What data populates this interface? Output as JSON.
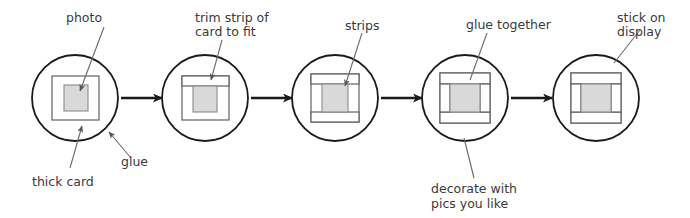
{
  "diagram": {
    "type": "process-flow",
    "step_count": 5,
    "colors": {
      "stroke": "#1a1a1a",
      "frame_stroke": "#555555",
      "photo_fill": "#d9d9d9",
      "strip_fill": "#ffffff",
      "text": "#3a3a3a",
      "leader": "#6b6b6b",
      "background": "#ffffff"
    },
    "steps": [
      {
        "id": "step-1",
        "caption": "photo, thick card, glue"
      },
      {
        "id": "step-2",
        "caption": "trim strip of card to fit"
      },
      {
        "id": "step-3",
        "caption": "strips"
      },
      {
        "id": "step-4",
        "caption": "glue together, decorate with pics you like"
      },
      {
        "id": "step-5",
        "caption": "stick on display"
      }
    ],
    "labels": [
      {
        "id": "photo",
        "text": "photo",
        "lines": [
          "photo"
        ],
        "position": "top",
        "target_step": 1
      },
      {
        "id": "trim-strip",
        "text": "trim strip of card to fit",
        "lines": [
          "trim strip of",
          "card to fit"
        ],
        "position": "top",
        "target_step": 2
      },
      {
        "id": "strips",
        "text": "strips",
        "lines": [
          "strips"
        ],
        "position": "top",
        "target_step": 3
      },
      {
        "id": "glue-together",
        "text": "glue together",
        "lines": [
          "glue together"
        ],
        "position": "top",
        "target_step": 4
      },
      {
        "id": "stick-on-display",
        "text": "stick on display",
        "lines": [
          "stick on",
          "display"
        ],
        "position": "top",
        "target_step": 5
      },
      {
        "id": "glue",
        "text": "glue",
        "lines": [
          "glue"
        ],
        "position": "bottom",
        "target_step": 1
      },
      {
        "id": "thick-card",
        "text": "thick card",
        "lines": [
          "thick card"
        ],
        "position": "bottom",
        "target_step": 1
      },
      {
        "id": "decorate",
        "text": "decorate with pics you like",
        "lines": [
          "decorate with",
          "pics you like"
        ],
        "position": "bottom",
        "target_step": 4
      }
    ],
    "arrows": [
      {
        "id": "arrow-1-2",
        "from": "step-1",
        "to": "step-2"
      },
      {
        "id": "arrow-2-3",
        "from": "step-2",
        "to": "step-3"
      },
      {
        "id": "arrow-3-4",
        "from": "step-3",
        "to": "step-4"
      },
      {
        "id": "arrow-4-5",
        "from": "step-4",
        "to": "step-5"
      }
    ]
  }
}
